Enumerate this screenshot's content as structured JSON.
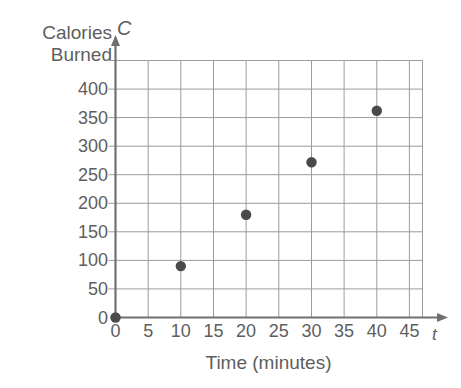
{
  "chart_data": {
    "type": "scatter",
    "title": "",
    "xlabel": "Time (minutes)",
    "ylabel": "Calories Burned",
    "ylabel_lines": [
      "Calories",
      "Burned"
    ],
    "x_axis_variable": "t",
    "y_axis_variable": "C",
    "x": [
      0,
      10,
      20,
      30,
      40
    ],
    "values": [
      0,
      90,
      180,
      272,
      362
    ],
    "points": [
      {
        "t": 0,
        "C": 0
      },
      {
        "t": 10,
        "C": 90
      },
      {
        "t": 20,
        "C": 180
      },
      {
        "t": 30,
        "C": 272
      },
      {
        "t": 40,
        "C": 362
      }
    ],
    "xticks": [
      0,
      5,
      10,
      15,
      20,
      25,
      30,
      35,
      40,
      45
    ],
    "xtick_labels": [
      "0",
      "5",
      "10",
      "15",
      "20",
      "25",
      "30",
      "35",
      "40",
      "45"
    ],
    "yticks": [
      0,
      50,
      100,
      150,
      200,
      250,
      300,
      350,
      400
    ],
    "ytick_labels": [
      "0",
      "50",
      "100",
      "150",
      "200",
      "250",
      "300",
      "350",
      "400"
    ],
    "xlim": [
      0,
      47
    ],
    "ylim": [
      0,
      450
    ],
    "grid": true,
    "grid_x_values": [
      5,
      10,
      15,
      20,
      25,
      30,
      35,
      40,
      45
    ],
    "grid_y_values": [
      50,
      100,
      150,
      200,
      250,
      300,
      350,
      400,
      450
    ],
    "legend": null,
    "legend_position": "none",
    "marker": "filled-circle",
    "colors": {
      "marker": "#4a4a4a",
      "grid": "#9c9c9c",
      "axis": "#707070",
      "text": "#5e5e5e",
      "background": "#ffffff"
    }
  }
}
